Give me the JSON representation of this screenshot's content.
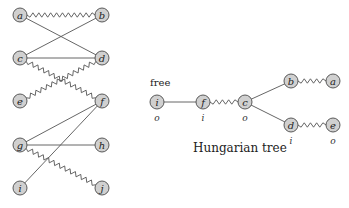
{
  "left_graph": {
    "nodes": [
      {
        "id": "a",
        "label": "a",
        "x": 20,
        "y": 15
      },
      {
        "id": "b",
        "label": "b",
        "x": 102,
        "y": 15
      },
      {
        "id": "c",
        "label": "c",
        "x": 20,
        "y": 58
      },
      {
        "id": "d",
        "label": "d",
        "x": 102,
        "y": 58
      },
      {
        "id": "e",
        "label": "e",
        "x": 20,
        "y": 101
      },
      {
        "id": "f",
        "label": "f",
        "x": 102,
        "y": 101
      },
      {
        "id": "g",
        "label": "g",
        "x": 20,
        "y": 145
      },
      {
        "id": "h",
        "label": "h",
        "x": 102,
        "y": 145
      },
      {
        "id": "i",
        "label": "i",
        "x": 20,
        "y": 188
      },
      {
        "id": "j",
        "label": "j",
        "x": 102,
        "y": 188
      }
    ],
    "edges": [
      {
        "from": "a",
        "to": "b",
        "type": "matching"
      },
      {
        "from": "a",
        "to": "d",
        "type": "plain"
      },
      {
        "from": "c",
        "to": "b",
        "type": "plain"
      },
      {
        "from": "c",
        "to": "d",
        "type": "plain"
      },
      {
        "from": "c",
        "to": "f",
        "type": "matching"
      },
      {
        "from": "e",
        "to": "d",
        "type": "matching"
      },
      {
        "from": "g",
        "to": "f",
        "type": "plain"
      },
      {
        "from": "g",
        "to": "h",
        "type": "plain"
      },
      {
        "from": "g",
        "to": "j",
        "type": "matching"
      },
      {
        "from": "i",
        "to": "f",
        "type": "plain"
      }
    ]
  },
  "tree": {
    "free_label": "free",
    "caption": "Hungarian tree",
    "nodes": [
      {
        "id": "i",
        "label": "i",
        "x": 157,
        "y": 102,
        "side": "o"
      },
      {
        "id": "f",
        "label": "f",
        "x": 203,
        "y": 102,
        "side": "i"
      },
      {
        "id": "c",
        "label": "c",
        "x": 245,
        "y": 102,
        "side": "o"
      },
      {
        "id": "b",
        "label": "b",
        "x": 291,
        "y": 81,
        "side": ""
      },
      {
        "id": "a",
        "label": "a",
        "x": 333,
        "y": 81,
        "side": ""
      },
      {
        "id": "d",
        "label": "d",
        "x": 291,
        "y": 125,
        "side": "i"
      },
      {
        "id": "e",
        "label": "e",
        "x": 333,
        "y": 125,
        "side": "o"
      }
    ],
    "edges": [
      {
        "from": "i",
        "to": "f",
        "type": "plain"
      },
      {
        "from": "f",
        "to": "c",
        "type": "matching"
      },
      {
        "from": "c",
        "to": "b",
        "type": "plain"
      },
      {
        "from": "b",
        "to": "a",
        "type": "matching"
      },
      {
        "from": "c",
        "to": "d",
        "type": "plain"
      },
      {
        "from": "d",
        "to": "e",
        "type": "matching"
      }
    ]
  }
}
